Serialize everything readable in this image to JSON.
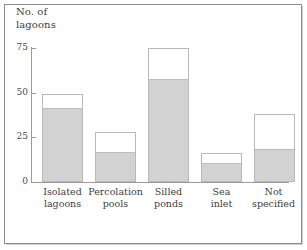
{
  "chart_data": {
    "type": "bar",
    "title": "",
    "xlabel": "",
    "ylabel": "No. of\nlagoons",
    "ylim": [
      0,
      75
    ],
    "yticks": [
      0,
      25,
      50,
      75
    ],
    "ytick_labels": [
      "0",
      "25",
      "50",
      "75"
    ],
    "grid": false,
    "legend": "none",
    "stacked": true,
    "categories": [
      "Isolated\nlagoons",
      "Percolation\npools",
      "Silled\nponds",
      "Sea\ninlet",
      "Not\nspecified"
    ],
    "series": [
      {
        "name": "shaded-lower",
        "color": "#d2d2d2",
        "values": [
          41,
          16,
          57,
          10,
          18
        ]
      },
      {
        "name": "unshaded-upper",
        "color": "#ffffff",
        "values": [
          8,
          12,
          18,
          6,
          20
        ]
      }
    ],
    "totals": [
      49,
      28,
      75,
      16,
      38
    ]
  },
  "axis": {
    "y_title": "No. of\nlagoons",
    "ticks": [
      {
        "label": "75",
        "value": 75
      },
      {
        "label": "50",
        "value": 50
      },
      {
        "label": "25",
        "value": 25
      },
      {
        "label": "0",
        "value": 0
      }
    ]
  },
  "bars": [
    {
      "label": "Isolated\nlagoons",
      "total": 49,
      "lower": 41
    },
    {
      "label": "Percolation\npools",
      "total": 28,
      "lower": 16
    },
    {
      "label": "Silled\nponds",
      "total": 75,
      "lower": 57
    },
    {
      "label": "Sea\ninlet",
      "total": 16,
      "lower": 10
    },
    {
      "label": "Not\nspecified",
      "total": 38,
      "lower": 18
    }
  ],
  "colors": {
    "bar_fill_lower": "#d2d2d2",
    "bar_fill_upper": "#ffffff",
    "bar_outline": "#b9b9b9",
    "axis": "#9a9a9a",
    "frame": "#8d8d8d",
    "text": "#3d3d3d"
  }
}
